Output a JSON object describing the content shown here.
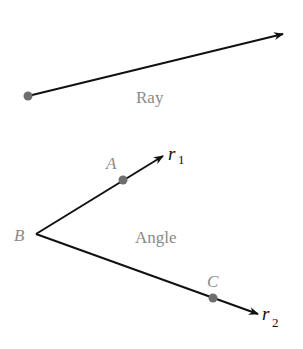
{
  "ray": {
    "label": "Ray",
    "start": [
      28,
      96
    ],
    "end": [
      283,
      34
    ]
  },
  "angle": {
    "label": "Angle",
    "vertex": {
      "name": "B",
      "pos": [
        36,
        234
      ]
    },
    "ray1": {
      "name": "r",
      "sub": "1",
      "end": [
        163,
        156
      ],
      "point": {
        "name": "A",
        "pos": [
          123,
          180
        ]
      }
    },
    "ray2": {
      "name": "r",
      "sub": "2",
      "end": [
        258,
        314
      ],
      "point": {
        "name": "C",
        "pos": [
          213,
          298
        ]
      }
    }
  },
  "colors": {
    "line": "#111111",
    "dot": "#6e6e6e",
    "label_gray": "#8a8a8a",
    "label_dark": "#111111"
  }
}
